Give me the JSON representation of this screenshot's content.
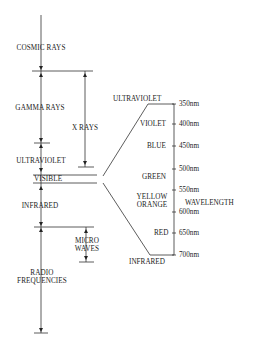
{
  "diagram": {
    "left_bands": [
      {
        "label": "COSMIC RAYS"
      },
      {
        "label": "GAMMA RAYS"
      },
      {
        "label": "X RAYS"
      },
      {
        "label": "ULTRAVIOLET"
      },
      {
        "label": "VISIBLE"
      },
      {
        "label": "INFRARED"
      },
      {
        "label": "MICRO",
        "label2": "WAVES"
      },
      {
        "label": "RADIO",
        "label2": "FREQUENCIES"
      }
    ],
    "visible_detail": {
      "top_label": "ULTRAVIOLET",
      "bottom_label": "INFRARED",
      "axis_label": "WAVELENGTH",
      "colors": [
        {
          "label": "VIOLET"
        },
        {
          "label": "BLUE"
        },
        {
          "label": "GREEN"
        },
        {
          "label": "YELLOW",
          "label2": "ORANGE"
        },
        {
          "label": "RED"
        }
      ],
      "ticks": [
        "350nm",
        "400nm",
        "450nm",
        "500nm",
        "550nm",
        "600nm",
        "650nm",
        "700nm"
      ]
    }
  }
}
